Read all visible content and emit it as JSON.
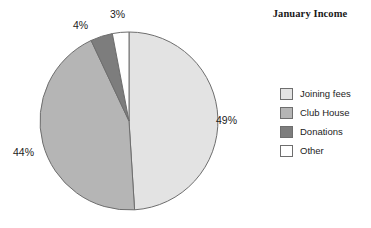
{
  "chart_data": {
    "type": "pie",
    "title": "January Income",
    "xlabel": "",
    "ylabel": "",
    "legend_position": "right",
    "grid": false,
    "start_angle_deg": 0,
    "direction": "clockwise",
    "categories": [
      "Joining fees",
      "Club House",
      "Donations",
      "Other"
    ],
    "values": [
      49,
      44,
      4,
      3
    ],
    "value_unit": "%",
    "data_labels": [
      "49%",
      "44%",
      "4%",
      "3%"
    ],
    "slice_colors": [
      "#e3e3e3",
      "#b5b5b5",
      "#7d7d7d",
      "#ffffff"
    ],
    "slice_border_color": "#6e6e6e"
  },
  "title": {
    "text": "January Income"
  },
  "pie": {
    "slices": [
      {
        "label": "Joining fees",
        "percent_label": "49%",
        "value": 49,
        "color": "#e3e3e3"
      },
      {
        "label": "Club House",
        "percent_label": "44%",
        "value": 44,
        "color": "#b5b5b5"
      },
      {
        "label": "Donations",
        "percent_label": "4%",
        "value": 4,
        "color": "#7d7d7d"
      },
      {
        "label": "Other",
        "percent_label": "3%",
        "value": 3,
        "color": "#ffffff"
      }
    ]
  },
  "legend": {
    "items": [
      {
        "label": "Joining fees",
        "color": "#e3e3e3"
      },
      {
        "label": "Club House",
        "color": "#b5b5b5"
      },
      {
        "label": "Donations",
        "color": "#7d7d7d"
      },
      {
        "label": "Other",
        "color": "#ffffff"
      }
    ]
  },
  "colors": {
    "slice_1": "#e3e3e3",
    "slice_2": "#b5b5b5",
    "slice_3": "#7d7d7d",
    "slice_4": "#ffffff",
    "outline": "#6e6e6e",
    "text": "#1c1c1c",
    "background": "#ffffff"
  }
}
